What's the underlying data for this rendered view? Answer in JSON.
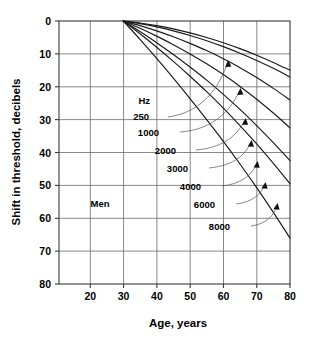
{
  "chart_data": {
    "type": "line",
    "title": "",
    "xlabel": "Age, years",
    "ylabel": "Shift in threshold, decibels",
    "group_label": "Men",
    "legend_header": "Hz",
    "legend_position": "inline-annotations",
    "grid": true,
    "xlim": [
      10.7,
      80
    ],
    "ylim": [
      0,
      80
    ],
    "y_inverted": true,
    "xticks": [
      20,
      30,
      40,
      50,
      60,
      70,
      80
    ],
    "yticks": [
      0,
      10,
      20,
      30,
      40,
      50,
      60,
      70,
      80
    ],
    "xtick_labels": [
      "20",
      "30",
      "40",
      "50",
      "60",
      "70",
      "80"
    ],
    "ytick_labels": [
      "0",
      "10",
      "20",
      "30",
      "40",
      "50",
      "60",
      "70",
      "80"
    ],
    "x": [
      30,
      35,
      40,
      45,
      50,
      55,
      60,
      65,
      70,
      75,
      80
    ],
    "series": [
      {
        "name": "250",
        "label": "250",
        "values": [
          0,
          0.6,
          1.4,
          2.4,
          3.6,
          5.0,
          6.6,
          8.4,
          10.4,
          12.6,
          15.0
        ]
      },
      {
        "name": "1000",
        "label": "1000",
        "values": [
          0,
          0.8,
          1.8,
          3.0,
          4.4,
          6.0,
          7.8,
          9.8,
          12.0,
          14.4,
          17.0
        ]
      },
      {
        "name": "2000",
        "label": "2000",
        "values": [
          0,
          1.4,
          3.0,
          4.8,
          6.8,
          9.0,
          11.5,
          14.2,
          17.2,
          20.5,
          24.0
        ]
      },
      {
        "name": "3000",
        "label": "3000",
        "values": [
          0,
          2.2,
          4.6,
          7.2,
          10.0,
          13.0,
          16.3,
          19.9,
          23.8,
          28.0,
          32.5
        ]
      },
      {
        "name": "4000",
        "label": "4000",
        "values": [
          0,
          3.2,
          6.6,
          10.2,
          14.0,
          18.0,
          22.3,
          26.9,
          31.8,
          37.0,
          42.5
        ]
      },
      {
        "name": "6000",
        "label": "6000",
        "values": [
          0,
          3.9,
          8.0,
          12.3,
          16.8,
          21.5,
          26.5,
          31.8,
          37.4,
          43.3,
          49.5
        ]
      },
      {
        "name": "8000",
        "label": "8000",
        "values": [
          0,
          5.6,
          11.4,
          17.4,
          23.6,
          30.0,
          36.6,
          43.5,
          50.7,
          58.2,
          66.0
        ]
      }
    ],
    "annotations": [
      {
        "text": "Hz",
        "x_px": 150,
        "y_px": 104
      },
      {
        "text": "250",
        "x_px": 149,
        "y_px": 120
      },
      {
        "text": "1000",
        "x_px": 159,
        "y_px": 136
      },
      {
        "text": "2000",
        "x_px": 176,
        "y_px": 154
      },
      {
        "text": "3000",
        "x_px": 188,
        "y_px": 172
      },
      {
        "text": "4000",
        "x_px": 201,
        "y_px": 190
      },
      {
        "text": "6000",
        "x_px": 215,
        "y_px": 208
      },
      {
        "text": "8000",
        "x_px": 230,
        "y_px": 230
      },
      {
        "text": "Men",
        "x_px": 100,
        "y_px": 207
      }
    ],
    "colors": {
      "curve": "#1a1a1a",
      "grid": "#6a6a6a",
      "frame": "#3a3a3a",
      "background": "#ffffff",
      "text": "#000000"
    }
  }
}
